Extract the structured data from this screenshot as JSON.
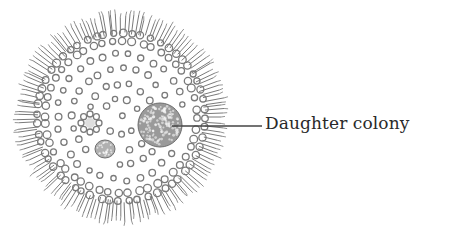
{
  "diagram": {
    "labels": [
      {
        "text": "Daughter colony",
        "points_to": "daughter-colony"
      }
    ],
    "colors": {
      "stroke": "#7a7a7a",
      "dense": "#6e6e6e",
      "leader": "#444444",
      "text": "#2a2a2a",
      "background": "#ffffff"
    }
  }
}
